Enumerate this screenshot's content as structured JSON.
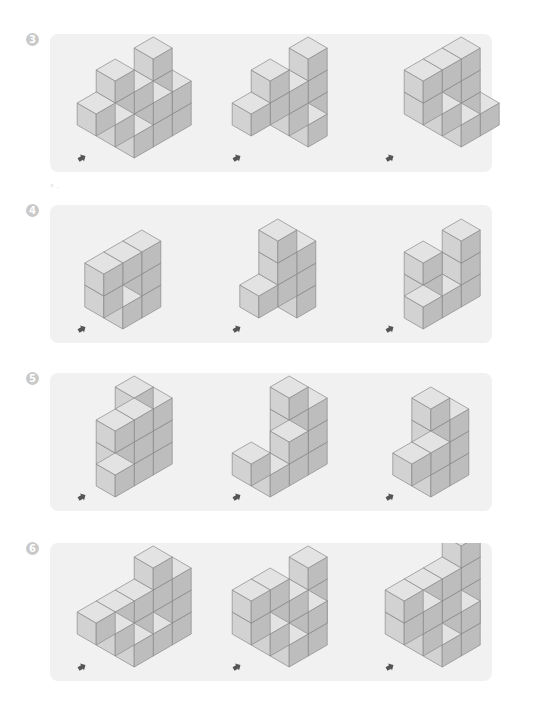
{
  "colors": {
    "panel_bg": "#f1f1f1",
    "badge_bg": "#c9c9c9",
    "cube_top": "#e3e3e3",
    "cube_left": "#d2d2d2",
    "cube_right": "#bdbdbd",
    "cube_edge": "#8a8a8a",
    "arrow": "#555555"
  },
  "problems": [
    {
      "number": "3",
      "top": 34,
      "figures": [
        {
          "label": "3-1",
          "heights": [
            [
              0,
              3,
              2
            ],
            [
              2,
              2,
              2
            ],
            [
              1,
              1,
              1
            ]
          ]
        },
        {
          "label": "3-2",
          "heights": [
            [
              0,
              3,
              0
            ],
            [
              2,
              2,
              1
            ],
            [
              1,
              0,
              0
            ]
          ]
        },
        {
          "label": "3-3",
          "heights": [
            [
              2,
              3,
              1
            ],
            [
              2,
              1,
              1
            ],
            [
              0,
              0,
              0
            ]
          ]
        }
      ]
    },
    {
      "number": "4",
      "top": 205,
      "figures": [
        {
          "label": "4-1",
          "heights": [
            [
              2,
              3
            ],
            [
              2,
              1
            ]
          ]
        },
        {
          "label": "4-2",
          "heights": [
            [
              3,
              3
            ],
            [
              1,
              0
            ]
          ]
        },
        {
          "label": "4-3",
          "heights": [
            [
              0,
              3
            ],
            [
              2,
              1
            ],
            [
              0,
              1
            ]
          ]
        }
      ]
    },
    {
      "number": "5",
      "top": 373,
      "figures": [
        {
          "label": "5-1",
          "heights": [
            [
              3,
              3
            ],
            [
              2,
              3
            ],
            [
              0,
              1
            ]
          ]
        },
        {
          "label": "5-2",
          "heights": [
            [
              3,
              3
            ],
            [
              0,
              2
            ],
            [
              1,
              1
            ]
          ]
        },
        {
          "label": "5-3",
          "heights": [
            [
              3,
              3
            ],
            [
              1,
              2
            ]
          ]
        }
      ]
    },
    {
      "number": "6",
      "top": 543,
      "figures": [
        {
          "label": "6-1",
          "heights": [
            [
              0,
              3,
              3
            ],
            [
              1,
              2,
              1
            ],
            [
              1,
              1,
              1
            ]
          ]
        },
        {
          "label": "6-2",
          "heights": [
            [
              0,
              3,
              0
            ],
            [
              2,
              2,
              2
            ],
            [
              2,
              1,
              1
            ]
          ]
        },
        {
          "label": "6-3",
          "heights": [
            [
              0,
              4,
              0
            ],
            [
              2,
              3,
              2
            ],
            [
              2,
              2,
              1
            ]
          ]
        }
      ]
    }
  ],
  "figure_positions": [
    {
      "left": 10,
      "arrow_x": 18
    },
    {
      "left": 165,
      "arrow_x": 18
    },
    {
      "left": 318,
      "arrow_x": 18
    }
  ]
}
